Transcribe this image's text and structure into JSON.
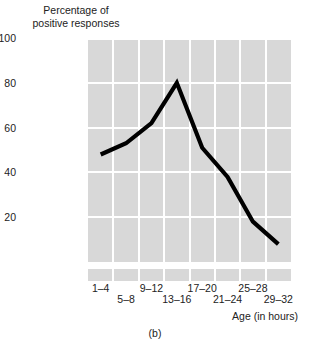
{
  "chart_data": {
    "type": "line",
    "title": "",
    "subtitle": "",
    "ylabel": "Percentage of\npositive responses",
    "xlabel": "Age (in hours)",
    "caption": "(b)",
    "categories": [
      "1–4",
      "5–8",
      "9–12",
      "13–16",
      "17–20",
      "21–24",
      "25–28",
      "29–32"
    ],
    "values": [
      48,
      53,
      62,
      80,
      51,
      38,
      18,
      8
    ],
    "series": [
      {
        "name": "positive responses",
        "values": [
          48,
          53,
          62,
          80,
          51,
          38,
          18,
          8
        ],
        "color": "#000000"
      }
    ],
    "ylim": [
      0,
      100
    ],
    "yticks": [
      100,
      80,
      60,
      40,
      20
    ],
    "ytick_labels": [
      "100",
      "80",
      "60",
      "40",
      "20"
    ],
    "grid": true,
    "grid_color": "#ffffff",
    "plot_bg": "#d8d8d8",
    "legend": "none"
  },
  "axis": {
    "y_title": "Percentage of\npositive responses",
    "x_title": "Age (in hours)",
    "y_ticks": [
      {
        "label": "100",
        "value": 100
      },
      {
        "label": "80",
        "value": 80
      },
      {
        "label": "60",
        "value": 60
      },
      {
        "label": "40",
        "value": 40
      },
      {
        "label": "20",
        "value": 20
      }
    ],
    "x_ticks": [
      {
        "label": "1–4",
        "row": "top"
      },
      {
        "label": "5–8",
        "row": "bottom"
      },
      {
        "label": "9–12",
        "row": "top"
      },
      {
        "label": "13–16",
        "row": "bottom"
      },
      {
        "label": "17–20",
        "row": "top"
      },
      {
        "label": "21–24",
        "row": "bottom"
      },
      {
        "label": "25–28",
        "row": "top"
      },
      {
        "label": "29–32",
        "row": "bottom"
      }
    ]
  },
  "figure": {
    "caption": "(b)"
  }
}
